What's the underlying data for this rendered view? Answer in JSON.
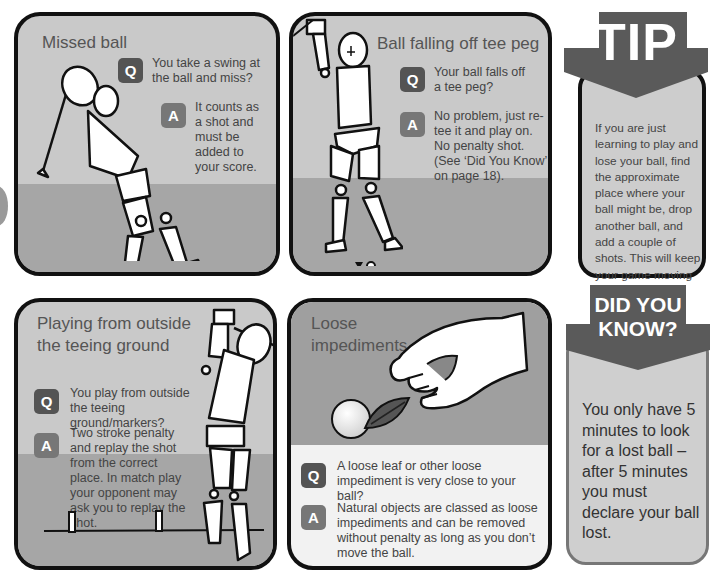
{
  "panels": {
    "missed_ball": {
      "title": "Missed ball",
      "q_badge": "Q",
      "question": "You take a swing at the ball and miss?",
      "a_badge": "A",
      "answer": "It counts as a shot and must be added to your score."
    },
    "ball_falling": {
      "title": "Ball falling off tee peg",
      "q_badge": "Q",
      "question": "Your ball falls off a tee peg?",
      "a_badge": "A",
      "answer": "No problem, just re-tee it and play on. No penalty shot. (See ‘Did You Know’ on page 18)."
    },
    "outside_teeing": {
      "title_line1": "Playing from outside",
      "title_line2": "the teeing ground",
      "q_badge": "Q",
      "question": "You play from outside the teeing ground/markers?",
      "a_badge": "A",
      "answer": "Two stroke penalty and replay the shot from the correct place. In match play your opponent may ask you to replay the shot."
    },
    "loose_impediments": {
      "title_line1": "Loose",
      "title_line2": "impediments",
      "q_badge": "Q",
      "question": "A loose leaf or other loose impediment is very close to your ball?",
      "a_badge": "A",
      "answer": "Natural objects are classed as loose impediments and can be removed without penalty as long as you don’t move the ball."
    }
  },
  "tip": {
    "heading": "TIP",
    "body": "If you are just learning to play and lose your ball, find the approximate place where your ball might be, drop another ball, and add a couple of shots. This will keep your game moving quicker."
  },
  "did_you_know": {
    "heading_line1": "DID YOU",
    "heading_line2": "KNOW?",
    "body": "You only have 5 minutes to look for a lost ball – after 5 minutes you must declare your ball lost."
  },
  "colors": {
    "panel_light": "#c9c9c9",
    "panel_ground": "#a6a6a6",
    "header_dark": "#5a5a5a",
    "q_badge": "#545454",
    "a_badge": "#777777"
  }
}
